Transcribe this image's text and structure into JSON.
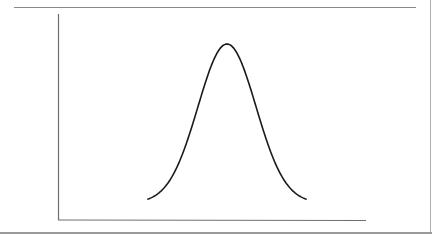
{
  "figure": {
    "axis_color": "#6e6e6e",
    "curve_color": "#1a1a1a",
    "rule_color": "#8a8a8a"
  },
  "chart_data": {
    "type": "line",
    "title": "",
    "xlabel": "",
    "ylabel": "",
    "grid": false,
    "legend": null,
    "series": [
      {
        "name": "normal-curve",
        "shape": "gaussian",
        "x": [
          -3,
          -2.5,
          -2,
          -1.5,
          -1,
          -0.5,
          0,
          0.5,
          1,
          1.5,
          2,
          2.5,
          3
        ],
        "values": [
          0.011,
          0.044,
          0.135,
          0.325,
          0.607,
          0.882,
          1.0,
          0.882,
          0.607,
          0.325,
          0.135,
          0.044,
          0.011
        ]
      }
    ]
  }
}
